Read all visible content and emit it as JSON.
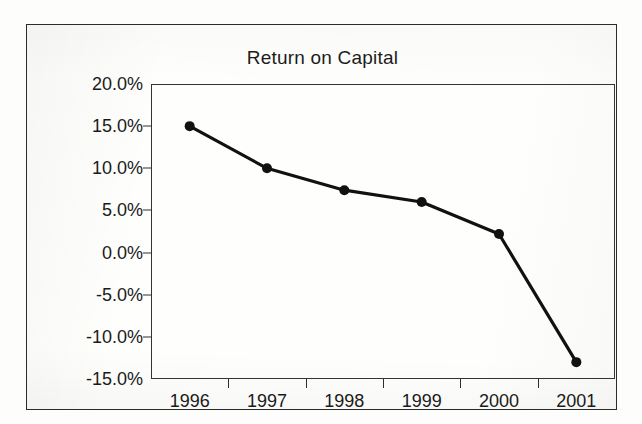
{
  "chart_data": {
    "type": "line",
    "title": "Return on Capital",
    "xlabel": "",
    "ylabel": "",
    "categories": [
      "1996",
      "1997",
      "1998",
      "1999",
      "2000",
      "2001"
    ],
    "values": [
      0.15,
      0.1,
      0.074,
      0.06,
      0.022,
      -0.13
    ],
    "value_labels": [
      "15.0%",
      "10.0%",
      "7.4%",
      "6.0%",
      "2.2%",
      "-13.0%"
    ],
    "series": [
      {
        "name": "Return on Capital",
        "values": [
          0.15,
          0.1,
          0.074,
          0.06,
          0.022,
          -0.13
        ]
      }
    ],
    "ylim": [
      -0.15,
      0.2
    ],
    "ytick_values": [
      0.2,
      0.15,
      0.1,
      0.05,
      0.0,
      -0.05,
      -0.1,
      -0.15
    ],
    "ytick_labels": [
      "20.0%",
      "15.0%",
      "10.0%",
      "5.0%",
      "0.0%",
      "-5.0%",
      "-10.0%",
      "-15.0%"
    ],
    "grid": false,
    "legend": "none",
    "line_color": "#111111",
    "marker": "circle",
    "marker_color": "#111111"
  },
  "frame": {
    "border_color": "#2b2b2b",
    "background_color": "#fefefc"
  }
}
